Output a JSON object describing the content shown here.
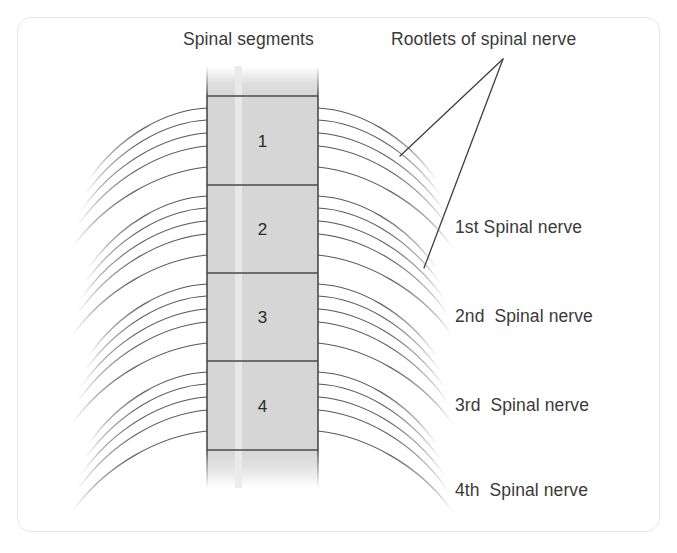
{
  "figure": {
    "title_left": "Spinal segments",
    "title_right": "Rootlets of spinal nerve",
    "segments": [
      {
        "number": "1",
        "y_top": 96,
        "y_bottom": 185
      },
      {
        "number": "2",
        "y_top": 185,
        "y_bottom": 273
      },
      {
        "number": "3",
        "y_top": 273,
        "y_bottom": 361
      },
      {
        "number": "4",
        "y_top": 361,
        "y_bottom": 450
      }
    ],
    "nerve_labels": [
      {
        "text": "1st Spinal nerve"
      },
      {
        "text": "2nd  Spinal nerve"
      },
      {
        "text": "3rd  Spinal nerve"
      },
      {
        "text": "4th  Spinal nerve"
      }
    ],
    "colors": {
      "cord_fill": "#d6d6d6",
      "cord_stripe": "#e6e6e6",
      "cord_border": "#4a4a4a",
      "rootlet_stroke": "#555555",
      "leader_stroke": "#3f3f3f",
      "frame_border": "#e7e7e7",
      "text": "#3a3a3a",
      "background": "#ffffff"
    },
    "cord": {
      "x_left": 207,
      "x_right": 318,
      "stripe_x": 238,
      "y_fade_top": 68,
      "y_fade_bottom": 487
    }
  }
}
